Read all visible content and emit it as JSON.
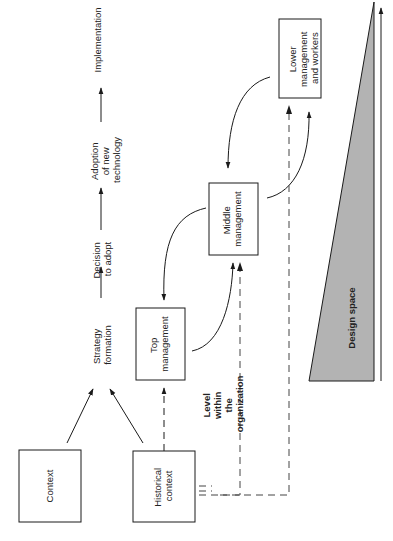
{
  "diagram": {
    "process_flow": [
      {
        "id": "strategy",
        "lines": [
          "Strategy",
          "formation"
        ]
      },
      {
        "id": "decision",
        "lines": [
          "Decision",
          "to adopt"
        ]
      },
      {
        "id": "adoption",
        "lines": [
          "Adoption",
          "of new",
          "technology"
        ]
      },
      {
        "id": "implementation",
        "lines": [
          "Implementation"
        ]
      }
    ],
    "boxes": {
      "context": {
        "lines": [
          "Context"
        ]
      },
      "historical": {
        "lines": [
          "Historical",
          "context"
        ]
      },
      "top": {
        "lines": [
          "Top",
          "management"
        ]
      },
      "middle": {
        "lines": [
          "Middle",
          "management"
        ]
      },
      "lower": {
        "lines": [
          "Lower",
          "management",
          "and workers"
        ]
      }
    },
    "level_label": [
      "Level",
      "within",
      "the",
      "organization"
    ],
    "design_space_label": "Design space",
    "colors": {
      "line": "#1a1a1a",
      "dashed": "#555555",
      "triangle_fill": "#b3b3b3",
      "background": "#ffffff"
    }
  }
}
